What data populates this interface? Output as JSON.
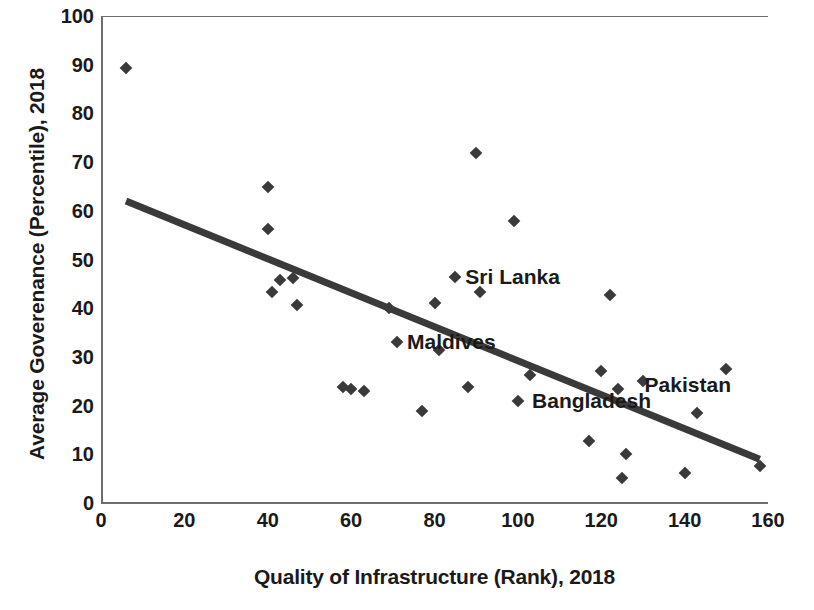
{
  "chart_data": {
    "type": "scatter",
    "title": "",
    "xlabel": "Quality of Infrastructure (Rank), 2018",
    "ylabel": "Average Goverenance (Percentile), 2018",
    "xlim": [
      0,
      160
    ],
    "ylim": [
      0,
      100
    ],
    "xticks": [
      0,
      20,
      40,
      60,
      80,
      100,
      120,
      140,
      160
    ],
    "yticks": [
      0,
      10,
      20,
      30,
      40,
      50,
      60,
      70,
      80,
      90,
      100
    ],
    "grid": false,
    "legend": "none",
    "marker": "diamond",
    "marker_color": "#3a3a3a",
    "trendline": {
      "type": "linear",
      "color": "#3a3a3a",
      "x_start": 6,
      "y_start": 62,
      "x_end": 158,
      "y_end": 9
    },
    "points": [
      {
        "x": 6,
        "y": 89.3
      },
      {
        "x": 40,
        "y": 64.8
      },
      {
        "x": 40,
        "y": 56.3
      },
      {
        "x": 41,
        "y": 43.4
      },
      {
        "x": 43,
        "y": 45.8
      },
      {
        "x": 46,
        "y": 46.3
      },
      {
        "x": 47,
        "y": 40.7
      },
      {
        "x": 58,
        "y": 23.9
      },
      {
        "x": 60,
        "y": 23.5
      },
      {
        "x": 63,
        "y": 22.9
      },
      {
        "x": 69,
        "y": 40.0
      },
      {
        "x": 71,
        "y": 33.0
      },
      {
        "x": 77,
        "y": 18.8
      },
      {
        "x": 80,
        "y": 41.0
      },
      {
        "x": 81,
        "y": 31.5
      },
      {
        "x": 85,
        "y": 46.5
      },
      {
        "x": 88,
        "y": 23.8
      },
      {
        "x": 90,
        "y": 71.8
      },
      {
        "x": 91,
        "y": 43.3
      },
      {
        "x": 99,
        "y": 58.0
      },
      {
        "x": 100,
        "y": 21.0
      },
      {
        "x": 103,
        "y": 26.2
      },
      {
        "x": 117,
        "y": 12.7
      },
      {
        "x": 120,
        "y": 27.2
      },
      {
        "x": 122,
        "y": 42.8
      },
      {
        "x": 124,
        "y": 23.5
      },
      {
        "x": 125,
        "y": 5.2
      },
      {
        "x": 126,
        "y": 10.0
      },
      {
        "x": 130,
        "y": 25.1
      },
      {
        "x": 140,
        "y": 6.2
      },
      {
        "x": 143,
        "y": 18.5
      },
      {
        "x": 150,
        "y": 27.5
      },
      {
        "x": 158,
        "y": 7.5
      }
    ],
    "annotations": [
      {
        "label": "Sri Lanka",
        "x": 85,
        "y": 46.5,
        "anchor": "right"
      },
      {
        "label": "Maldives",
        "x": 71,
        "y": 33.0,
        "anchor": "right"
      },
      {
        "label": "Bangladesh",
        "x": 101,
        "y": 21.0,
        "anchor": "right"
      },
      {
        "label": "Pakistan",
        "x": 128,
        "y": 24.3,
        "anchor": "right"
      }
    ]
  },
  "axes": {
    "ylabel": "Average Goverenance (Percentile), 2018",
    "xlabel": "Quality of Infrastructure (Rank), 2018",
    "ytick_labels": [
      "100",
      "90",
      "80",
      "70",
      "60",
      "50",
      "40",
      "30",
      "20",
      "10",
      "0"
    ],
    "xtick_labels": [
      "0",
      "20",
      "40",
      "60",
      "80",
      "100",
      "120",
      "140",
      "160"
    ]
  }
}
